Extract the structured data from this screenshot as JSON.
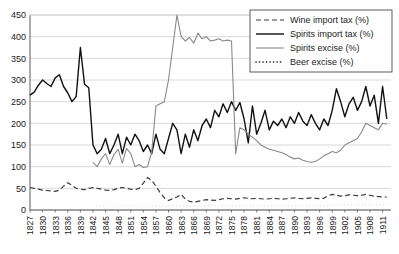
{
  "chart_data": {
    "type": "line",
    "title": "",
    "xlabel": "",
    "ylabel": "",
    "xlim": [
      1827,
      1913
    ],
    "ylim": [
      0,
      450
    ],
    "ytick_step": 50,
    "yticks": [
      0,
      50,
      100,
      150,
      200,
      250,
      300,
      350,
      400,
      450
    ],
    "xticks": [
      1827,
      1830,
      1833,
      1836,
      1839,
      1842,
      1845,
      1848,
      1851,
      1854,
      1857,
      1860,
      1863,
      1866,
      1869,
      1872,
      1875,
      1878,
      1881,
      1884,
      1887,
      1890,
      1893,
      1896,
      1899,
      1902,
      1905,
      1908,
      1911
    ],
    "grid": true,
    "grid_axis": "y",
    "legend_position": "top-right",
    "series": [
      {
        "name": "Wine import tax (%)",
        "color": "#3a3a3a",
        "style": "dashed",
        "width": 1.2,
        "x": [
          1827,
          1828,
          1829,
          1830,
          1831,
          1832,
          1833,
          1834,
          1835,
          1836,
          1837,
          1838,
          1839,
          1840,
          1841,
          1842,
          1843,
          1844,
          1845,
          1846,
          1847,
          1848,
          1849,
          1850,
          1851,
          1852,
          1853,
          1854,
          1855,
          1856,
          1857,
          1858,
          1859,
          1860,
          1861,
          1862,
          1863,
          1864,
          1865,
          1866,
          1867,
          1868,
          1869,
          1870,
          1871,
          1872,
          1873,
          1874,
          1875,
          1876,
          1877,
          1878,
          1879,
          1880,
          1881,
          1882,
          1883,
          1884,
          1885,
          1886,
          1887,
          1888,
          1889,
          1890,
          1891,
          1892,
          1893,
          1894,
          1895,
          1896,
          1897,
          1898,
          1899,
          1900,
          1901,
          1902,
          1903,
          1904,
          1905,
          1906,
          1907,
          1908,
          1909,
          1910,
          1911,
          1912
        ],
        "values": [
          52,
          50,
          48,
          46,
          45,
          44,
          43,
          46,
          55,
          63,
          57,
          50,
          48,
          47,
          50,
          52,
          50,
          48,
          46,
          45,
          47,
          50,
          52,
          50,
          48,
          47,
          50,
          62,
          75,
          68,
          55,
          40,
          28,
          22,
          26,
          30,
          36,
          25,
          20,
          18,
          20,
          22,
          24,
          23,
          22,
          24,
          26,
          27,
          26,
          25,
          27,
          28,
          27,
          26,
          27,
          26,
          25,
          26,
          27,
          26,
          25,
          26,
          27,
          28,
          27,
          26,
          27,
          28,
          27,
          26,
          27,
          33,
          36,
          34,
          32,
          33,
          35,
          34,
          33,
          34,
          36,
          34,
          32,
          31,
          30,
          30
        ]
      },
      {
        "name": "Spirits import tax (%)",
        "color": "#111111",
        "style": "solid",
        "width": 1.4,
        "x": [
          1827,
          1828,
          1829,
          1830,
          1831,
          1832,
          1833,
          1834,
          1835,
          1836,
          1837,
          1838,
          1839,
          1840,
          1841,
          1842,
          1843,
          1844,
          1845,
          1846,
          1847,
          1848,
          1849,
          1850,
          1851,
          1852,
          1853,
          1854,
          1855,
          1856,
          1857,
          1858,
          1859,
          1860,
          1861,
          1862,
          1863,
          1864,
          1865,
          1866,
          1867,
          1868,
          1869,
          1870,
          1871,
          1872,
          1873,
          1874,
          1875,
          1876,
          1877,
          1878,
          1879,
          1880,
          1881,
          1882,
          1883,
          1884,
          1885,
          1886,
          1887,
          1888,
          1889,
          1890,
          1891,
          1892,
          1893,
          1894,
          1895,
          1896,
          1897,
          1898,
          1899,
          1900,
          1901,
          1902,
          1903,
          1904,
          1905,
          1906,
          1907,
          1908,
          1909,
          1910,
          1911,
          1912
        ],
        "values": [
          265,
          272,
          288,
          300,
          292,
          285,
          305,
          312,
          285,
          270,
          250,
          262,
          375,
          290,
          282,
          150,
          130,
          140,
          165,
          130,
          150,
          175,
          130,
          168,
          150,
          175,
          160,
          135,
          150,
          130,
          175,
          140,
          130,
          165,
          200,
          185,
          130,
          175,
          145,
          185,
          160,
          195,
          210,
          190,
          230,
          215,
          245,
          225,
          250,
          230,
          248,
          210,
          155,
          240,
          175,
          200,
          230,
          185,
          205,
          195,
          210,
          190,
          215,
          200,
          225,
          205,
          195,
          220,
          200,
          185,
          210,
          195,
          230,
          280,
          250,
          215,
          245,
          260,
          230,
          250,
          285,
          240,
          265,
          200,
          285,
          210
        ]
      },
      {
        "name": "Spirits excise (%)",
        "color": "#8a8a8a",
        "style": "solid",
        "width": 1.1,
        "x": [
          1827,
          1828,
          1829,
          1830,
          1831,
          1832,
          1833,
          1834,
          1835,
          1836,
          1837,
          1838,
          1839,
          1840,
          1841,
          1842,
          1843,
          1844,
          1845,
          1846,
          1847,
          1848,
          1849,
          1850,
          1851,
          1852,
          1853,
          1854,
          1855,
          1856,
          1857,
          1858,
          1859,
          1860,
          1861,
          1862,
          1863,
          1864,
          1865,
          1866,
          1867,
          1868,
          1869,
          1870,
          1871,
          1872,
          1873,
          1874,
          1875,
          1876,
          1877,
          1878,
          1879,
          1880,
          1881,
          1882,
          1883,
          1884,
          1885,
          1886,
          1887,
          1888,
          1889,
          1890,
          1891,
          1892,
          1893,
          1894,
          1895,
          1896,
          1897,
          1898,
          1899,
          1900,
          1901,
          1902,
          1903,
          1904,
          1905,
          1906,
          1907,
          1908,
          1909,
          1910,
          1911,
          1912
        ],
        "values": [
          null,
          null,
          null,
          null,
          null,
          null,
          null,
          null,
          null,
          null,
          null,
          null,
          null,
          null,
          null,
          110,
          100,
          118,
          130,
          105,
          128,
          140,
          108,
          142,
          130,
          100,
          105,
          98,
          100,
          135,
          240,
          245,
          250,
          300,
          375,
          450,
          400,
          390,
          398,
          385,
          408,
          395,
          400,
          390,
          392,
          395,
          390,
          392,
          390,
          130,
          190,
          185,
          175,
          168,
          160,
          150,
          145,
          140,
          138,
          135,
          132,
          128,
          122,
          118,
          120,
          115,
          112,
          110,
          112,
          118,
          125,
          130,
          135,
          132,
          138,
          150,
          155,
          160,
          165,
          180,
          200,
          195,
          190,
          185,
          200,
          198
        ]
      },
      {
        "name": "Beer excise (%)",
        "color": "#111111",
        "style": "dotted",
        "width": 1.6,
        "x": [
          1842,
          1843,
          1844,
          1845,
          1846,
          1847,
          1848,
          1849,
          1850,
          1851,
          1852,
          1853,
          1854,
          1855,
          1856,
          1857,
          1858,
          1859,
          1860,
          1861,
          1862,
          1863,
          1864,
          1865,
          1866,
          1867,
          1868,
          1869,
          1870,
          1871,
          1872,
          1873,
          1874,
          1875,
          1876,
          1877,
          1878,
          1879,
          1880,
          1881,
          1882,
          1883,
          1884,
          1885,
          1886,
          1887,
          1888,
          1889,
          1890,
          1891,
          1892,
          1893,
          1894,
          1895,
          1896,
          1897,
          1898,
          1899,
          1900,
          1901,
          1902,
          1903,
          1904,
          1905,
          1906,
          1907,
          1908,
          1909,
          1910,
          1911,
          1912
        ],
        "values": [
          10,
          10,
          10,
          10,
          10,
          10,
          10,
          10,
          10,
          10,
          10,
          8,
          8,
          8,
          8,
          10,
          10,
          10,
          10,
          10,
          10,
          10,
          10,
          10,
          10,
          10,
          10,
          10,
          10,
          10,
          10,
          10,
          10,
          10,
          10,
          10,
          10,
          10,
          10,
          10,
          10,
          10,
          10,
          10,
          10,
          10,
          10,
          10,
          10,
          10,
          10,
          10,
          10,
          10,
          10,
          10,
          10,
          12,
          12,
          12,
          12,
          12,
          12,
          12,
          12,
          12,
          12,
          12,
          12,
          12,
          12
        ]
      }
    ]
  },
  "legend": {
    "items": [
      {
        "label": "Wine import tax (%)"
      },
      {
        "label": "Spirits import tax (%)"
      },
      {
        "label": "Spirits excise (%)"
      },
      {
        "label": "Beer excise (%)"
      }
    ]
  }
}
